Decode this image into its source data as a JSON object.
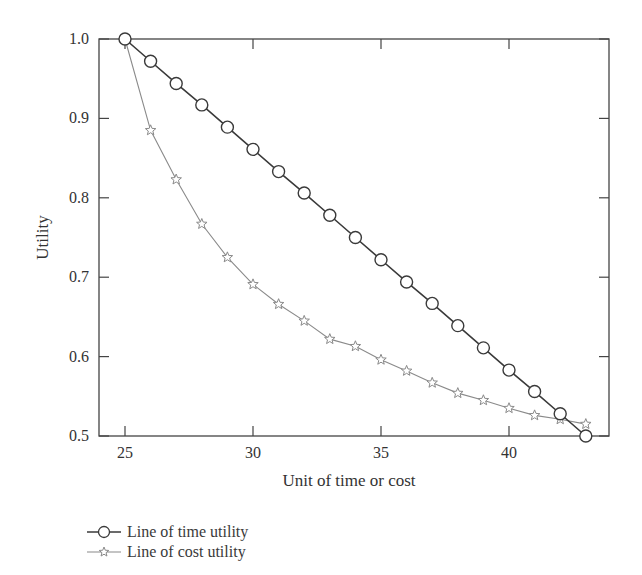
{
  "chart_data": {
    "type": "line",
    "title": "",
    "xlabel": "Unit of time or cost",
    "ylabel": "Utility",
    "xlim": [
      24,
      44
    ],
    "ylim": [
      0.5,
      1.0
    ],
    "xticks": [
      25,
      30,
      35,
      40
    ],
    "yticks": [
      0.5,
      0.6,
      0.7,
      0.8,
      0.9,
      1.0
    ],
    "ytick_labels": [
      "0.5",
      "0.6",
      "0.7",
      "0.8",
      "0.9",
      "1.0"
    ],
    "grid": false,
    "legend_position": "below-left",
    "x": [
      25,
      26,
      27,
      28,
      29,
      30,
      31,
      32,
      33,
      34,
      35,
      36,
      37,
      38,
      39,
      40,
      41,
      42,
      43
    ],
    "series": [
      {
        "name": "Line of time utility",
        "marker": "circle",
        "color": "#3a3a3a",
        "values": [
          1.0,
          0.972,
          0.944,
          0.917,
          0.889,
          0.861,
          0.833,
          0.806,
          0.778,
          0.75,
          0.722,
          0.694,
          0.667,
          0.639,
          0.611,
          0.583,
          0.556,
          0.528,
          0.5
        ]
      },
      {
        "name": "Line of cost utility",
        "marker": "star",
        "color": "#8a8a8a",
        "values": [
          1.0,
          0.885,
          0.823,
          0.767,
          0.725,
          0.691,
          0.666,
          0.645,
          0.622,
          0.613,
          0.596,
          0.582,
          0.567,
          0.554,
          0.545,
          0.535,
          0.526,
          0.521,
          0.515
        ]
      }
    ]
  },
  "legend": {
    "items": [
      {
        "label": "Line of time utility"
      },
      {
        "label": "Line of cost utility"
      }
    ]
  }
}
